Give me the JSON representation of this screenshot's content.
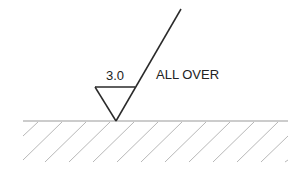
{
  "diagram": {
    "type": "surface-finish-symbol",
    "roughness_value": "3.0",
    "note": "ALL OVER",
    "colors": {
      "symbol": "#2a2a2a",
      "surface_line": "#9a9a9a",
      "hatch": "#b8b8b8",
      "background": "#ffffff"
    },
    "geometry": {
      "surface_line": {
        "x1": 23,
        "x2": 288,
        "y": 121
      },
      "triangle": {
        "top_left": [
          95,
          87
        ],
        "top_right": [
          135,
          87
        ],
        "apex": [
          116,
          121
        ]
      },
      "leader_end": [
        181,
        9
      ],
      "hatch_spacing": 24,
      "hatch_depth": 41
    }
  }
}
